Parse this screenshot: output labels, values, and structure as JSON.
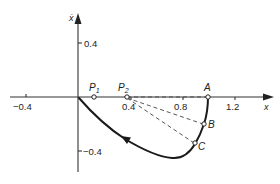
{
  "figure": {
    "type": "phase-plane-diagram",
    "axes": {
      "x_label": "x",
      "y_label": "ẋ",
      "x_ticks": [
        {
          "value": -0.4,
          "label": "−0.4"
        },
        {
          "value": 0.4,
          "label": "0.4"
        },
        {
          "value": 0.8,
          "label": "0.8"
        },
        {
          "value": 1.2,
          "label": "1.2"
        }
      ],
      "y_ticks": [
        {
          "value": 0.4,
          "label": "0.4"
        },
        {
          "value": -0.4,
          "label": "−0.4"
        }
      ]
    },
    "points": [
      {
        "id": "P1",
        "label": "P₁",
        "x": 0.12,
        "y": 0.0
      },
      {
        "id": "P2",
        "label": "P₂",
        "x": 0.38,
        "y": 0.0
      },
      {
        "id": "A",
        "label": "A",
        "x": 1.0,
        "y": 0.0
      },
      {
        "id": "B",
        "label": "B",
        "x": 0.97,
        "y": -0.2
      },
      {
        "id": "C",
        "label": "C",
        "x": 0.9,
        "y": -0.34
      }
    ],
    "dashed_lines": [
      {
        "from": "P2",
        "to": "A"
      },
      {
        "from": "P2",
        "to": "B"
      },
      {
        "from": "P2",
        "to": "C"
      }
    ],
    "trajectory": {
      "description": "Solid curve from A down through B and C to a minimum near (0.75, -0.44), then back toward the origin",
      "direction_arrow": "pointing toward origin",
      "color": "#1a1a1a"
    }
  },
  "labels": {
    "x_axis": "x",
    "y_axis": "ẋ",
    "tick_x_neg04": "−0.4",
    "tick_x_04": "0.4",
    "tick_x_08": "0.8",
    "tick_x_12": "1.2",
    "tick_y_04": "0.4",
    "tick_y_neg04": "−0.4",
    "p1": "P",
    "p1_sub": "1",
    "p2": "P",
    "p2_sub": "2",
    "a": "A",
    "b": "B",
    "c": "C"
  }
}
